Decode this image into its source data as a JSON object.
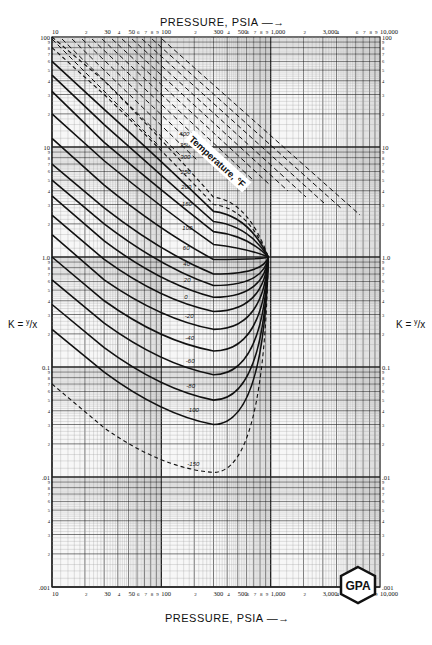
{
  "chart_data": {
    "type": "line",
    "xlabel": "PRESSURE, PSIA",
    "ylabel": "K = y/x",
    "xscale": "log",
    "yscale": "log",
    "xlim": [
      10,
      10000
    ],
    "ylim": [
      0.001,
      100
    ],
    "grid": true,
    "x_tick_labels": [
      "10",
      "2",
      "30",
      "4",
      "50",
      "6",
      "7",
      "8",
      "9",
      "100",
      "2",
      "300",
      "4",
      "500",
      "6",
      "7",
      "8",
      "9",
      "1,000",
      "2",
      "3,000",
      "4",
      "6",
      "7",
      "8",
      "9",
      "10,000"
    ],
    "x_major_ticks": [
      10,
      30,
      50,
      100,
      300,
      500,
      1000,
      3000,
      10000
    ],
    "y_tick_labels_left": [
      "100",
      "10",
      "1.0",
      "0.1",
      ".01",
      ".001"
    ],
    "y_tick_labels_right": [
      "100",
      "10",
      "1.0",
      "0.1",
      ".01",
      ".001"
    ],
    "y_minor_labels": [
      "9",
      "8",
      "7",
      "6",
      "5",
      "4",
      "3",
      "2"
    ],
    "curve_family_label": "Temperature, °F",
    "convergence_point": {
      "pressure_psia": 950,
      "K": 1.0
    },
    "series": [
      {
        "name": "400",
        "style": "dashed",
        "x": [
          10,
          30,
          100,
          300,
          950
        ],
        "y": [
          100,
          40,
          12,
          3.5,
          1.0
        ]
      },
      {
        "name": "350",
        "style": "dashed",
        "x": [
          10,
          30,
          100,
          300,
          950
        ],
        "y": [
          80,
          30,
          9.5,
          3.0,
          1.0
        ]
      },
      {
        "name": "300",
        "style": "solid",
        "x": [
          10,
          30,
          100,
          300,
          950
        ],
        "y": [
          60,
          22,
          7.5,
          2.6,
          1.0
        ]
      },
      {
        "name": "250",
        "style": "solid",
        "x": [
          10,
          30,
          100,
          300,
          950
        ],
        "y": [
          45,
          16,
          5.5,
          2.1,
          1.0
        ]
      },
      {
        "name": "200",
        "style": "solid",
        "x": [
          10,
          30,
          100,
          300,
          950
        ],
        "y": [
          32,
          11,
          4.0,
          1.7,
          1.0
        ]
      },
      {
        "name": "150",
        "style": "solid",
        "x": [
          10,
          30,
          100,
          300,
          950
        ],
        "y": [
          20,
          7.5,
          2.8,
          1.3,
          1.0
        ]
      },
      {
        "name": "100",
        "style": "solid",
        "x": [
          10,
          30,
          100,
          300,
          950
        ],
        "y": [
          12,
          4.5,
          1.7,
          0.95,
          1.0
        ]
      },
      {
        "name": "60",
        "style": "solid",
        "x": [
          10,
          30,
          100,
          300,
          950
        ],
        "y": [
          7,
          2.8,
          1.1,
          0.7,
          1.0
        ]
      },
      {
        "name": "40",
        "style": "solid",
        "x": [
          10,
          30,
          100,
          300,
          950
        ],
        "y": [
          5,
          2.0,
          0.8,
          0.55,
          1.0
        ]
      },
      {
        "name": "20",
        "style": "solid",
        "x": [
          10,
          30,
          100,
          300,
          950
        ],
        "y": [
          3.6,
          1.4,
          0.57,
          0.43,
          1.0
        ]
      },
      {
        "name": "0",
        "style": "solid",
        "x": [
          10,
          30,
          100,
          300,
          950
        ],
        "y": [
          2.4,
          0.95,
          0.4,
          0.32,
          1.0
        ]
      },
      {
        "name": "-20",
        "style": "solid",
        "x": [
          10,
          30,
          100,
          300,
          950
        ],
        "y": [
          1.6,
          0.62,
          0.27,
          0.22,
          1.0
        ]
      },
      {
        "name": "-40",
        "style": "solid",
        "x": [
          10,
          30,
          100,
          300,
          950
        ],
        "y": [
          1.0,
          0.4,
          0.17,
          0.14,
          1.0
        ]
      },
      {
        "name": "-60",
        "style": "solid",
        "x": [
          10,
          30,
          100,
          300,
          950
        ],
        "y": [
          0.62,
          0.25,
          0.105,
          0.085,
          1.0
        ]
      },
      {
        "name": "-80",
        "style": "solid",
        "x": [
          10,
          30,
          100,
          300,
          950
        ],
        "y": [
          0.37,
          0.15,
          0.062,
          0.05,
          1.0
        ]
      },
      {
        "name": "-100",
        "style": "solid",
        "x": [
          10,
          30,
          100,
          300,
          950
        ],
        "y": [
          0.22,
          0.09,
          0.037,
          0.03,
          1.0
        ]
      },
      {
        "name": "-150",
        "style": "dashed",
        "x": [
          10,
          30,
          100,
          300,
          950
        ],
        "y": [
          0.07,
          0.028,
          0.012,
          0.011,
          1.0
        ]
      }
    ],
    "legend": "none (curves labeled inline)"
  },
  "labels": {
    "top_axis_title": "PRESSURE, PSIA —→",
    "bottom_axis_title": "PRESSURE, PSIA —→",
    "left_axis_label_k": "K = ",
    "left_axis_label_frac": "y",
    "left_axis_label_den": "/x",
    "right_axis_label_k": "K = ",
    "right_axis_label_frac": "y",
    "right_axis_label_den": "/x",
    "temperature_banner": "Temperature, °F",
    "logo_text": "GPA"
  }
}
